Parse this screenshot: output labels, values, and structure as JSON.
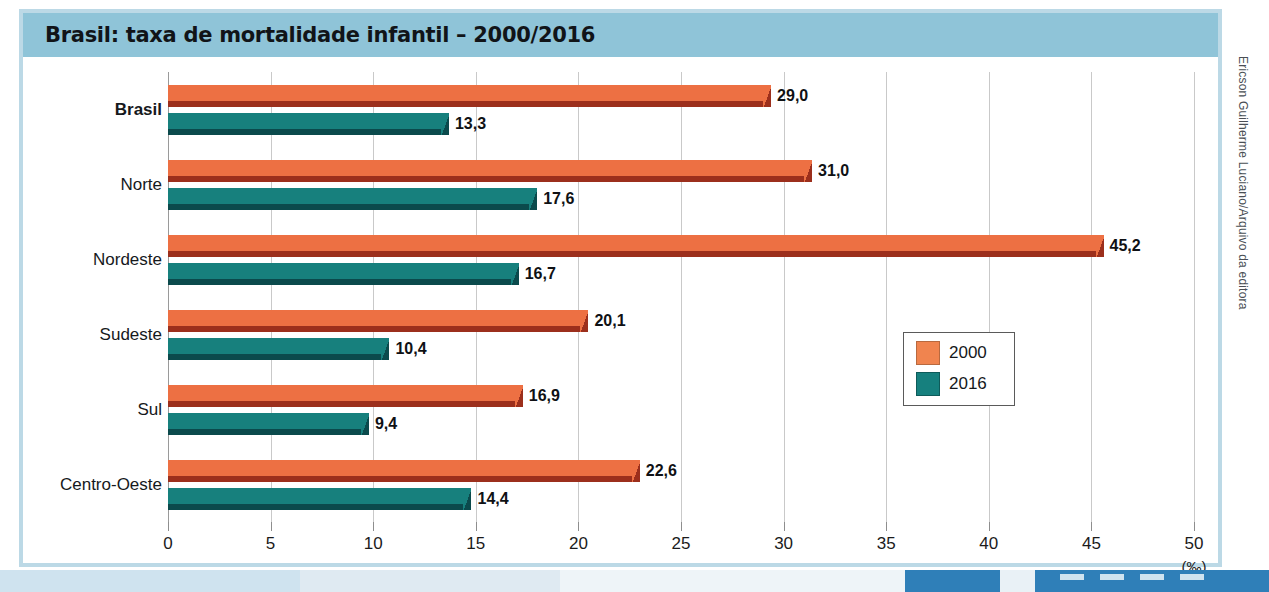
{
  "title": "Brasil: taxa de mortalidade infantil – 2000/2016",
  "credit": "Ericson Guilherme Luciano/Arquivo da editora",
  "colors": {
    "header_band": "#8fc4d8",
    "frame": "#bcd9e6",
    "series_2000": "#ed7043",
    "series_2000_shadow": "#9c2f1c",
    "series_2016": "#17807d",
    "series_2016_shadow": "#0b4a4c",
    "gridline": "#c9c9c9"
  },
  "legend": {
    "position": "middle-right",
    "entries": [
      {
        "label": "2000",
        "color": "#f0844f"
      },
      {
        "label": "2016",
        "color": "#16807e"
      }
    ]
  },
  "chart_data": {
    "type": "bar",
    "orientation": "horizontal",
    "title": "Brasil: taxa de mortalidade infantil – 2000/2016",
    "xlabel": "(‰)",
    "ylabel": "",
    "unit": "(‰)",
    "xlim": [
      0,
      50
    ],
    "xticks": [
      0,
      5,
      10,
      15,
      20,
      25,
      30,
      35,
      40,
      45,
      50
    ],
    "xticklabels": [
      "0",
      "5",
      "10",
      "15",
      "20",
      "25",
      "30",
      "35",
      "40",
      "45",
      "50"
    ],
    "grid": true,
    "grid_axis": "x",
    "categories": [
      "Brasil",
      "Norte",
      "Nordeste",
      "Sudeste",
      "Sul",
      "Centro-Oeste"
    ],
    "series": [
      {
        "name": "2000",
        "color": "#ed7043",
        "values": [
          29.0,
          31.0,
          45.2,
          20.1,
          16.9,
          22.6
        ],
        "labels": [
          "29,0",
          "31,0",
          "45,2",
          "20,1",
          "16,9",
          "22,6"
        ]
      },
      {
        "name": "2016",
        "color": "#17807d",
        "values": [
          13.3,
          17.6,
          16.7,
          10.4,
          9.4,
          14.4
        ],
        "labels": [
          "13,3",
          "17,6",
          "16,7",
          "10,4",
          "9,4",
          "14,4"
        ]
      }
    ]
  }
}
